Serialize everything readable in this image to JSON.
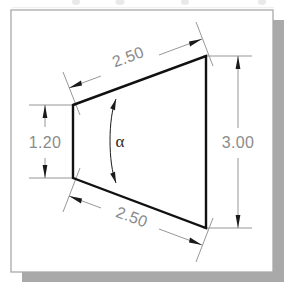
{
  "figure": {
    "kind": "engineering-dimension-drawing",
    "shape_name": "trapezoid",
    "background_color": "#ffffff",
    "page_frame_color": "#a9a9a9",
    "shadow_color": "#9a9a9a",
    "outline_color": "#111111",
    "dimension_color": "#8b8b8b",
    "angle_symbol_color": "#2b2b2b"
  },
  "dimensions": {
    "top_length": {
      "label": "2.50",
      "placement": "top",
      "orientation": "aligned-slanted",
      "arrows": "both-ends"
    },
    "bottom_length": {
      "label": "2.50",
      "placement": "bottom",
      "orientation": "aligned-slanted",
      "arrows": "both-ends"
    },
    "left_height": {
      "label": "1.20",
      "placement": "left",
      "orientation": "vertical",
      "arrows": "both-ends"
    },
    "right_height": {
      "label": "3.00",
      "placement": "right",
      "orientation": "vertical",
      "arrows": "both-ends"
    },
    "interior_angle": {
      "label": "α",
      "placement": "center",
      "orientation": "arc",
      "arrows": "both-ends"
    }
  },
  "geometry": {
    "vertices": {
      "top_left": {
        "x": 73,
        "y": 105
      },
      "top_right": {
        "x": 206,
        "y": 56
      },
      "bottom_right": {
        "x": 206,
        "y": 228
      },
      "bottom_left": {
        "x": 73,
        "y": 178
      }
    }
  }
}
